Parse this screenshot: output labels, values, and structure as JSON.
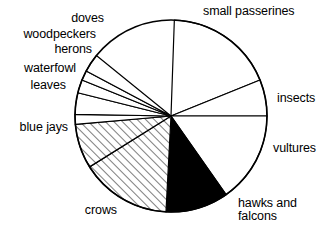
{
  "chart_data": {
    "type": "pie",
    "title": "",
    "subtitle": "",
    "xlabel": "",
    "ylabel": "",
    "legend_position": "outside-labels",
    "grid": false,
    "units": "percent",
    "start_angle_deg": 88,
    "direction": "clockwise",
    "center": {
      "x": 171,
      "y": 116
    },
    "radius": 96,
    "categories": [
      "small passerines",
      "insects",
      "vultures",
      "hawks and falcons",
      "crows",
      "blue jays",
      "leaves",
      "waterfowl",
      "herons",
      "woodpeckers",
      "doves"
    ],
    "values": [
      18.3,
      6.1,
      15.3,
      10.6,
      15.3,
      7.5,
      1.7,
      3.6,
      2.2,
      1.7,
      3.1
    ],
    "slices": [
      {
        "label": "small passerines",
        "value": 18.3,
        "start_deg": 88,
        "end_deg": 22,
        "fill": "white",
        "pattern": "none"
      },
      {
        "label": "insects",
        "value": 6.1,
        "start_deg": 22,
        "end_deg": 0,
        "fill": "white",
        "pattern": "none"
      },
      {
        "label": "vultures",
        "value": 15.3,
        "start_deg": 0,
        "end_deg": -55,
        "fill": "white",
        "pattern": "none"
      },
      {
        "label": "hawks and falcons",
        "value": 10.6,
        "start_deg": -55,
        "end_deg": -93,
        "fill": "black",
        "pattern": "solid"
      },
      {
        "label": "crows",
        "value": 15.3,
        "start_deg": -93,
        "end_deg": -148,
        "fill": "white",
        "pattern": "hatch"
      },
      {
        "label": "blue jays",
        "value": 7.5,
        "start_deg": -148,
        "end_deg": -175,
        "fill": "white",
        "pattern": "hatch"
      },
      {
        "label": "leaves",
        "value": 1.7,
        "start_deg": -175,
        "end_deg": 179,
        "fill": "white",
        "pattern": "none"
      },
      {
        "label": "waterfowl",
        "value": 3.6,
        "start_deg": 179,
        "end_deg": 166,
        "fill": "white",
        "pattern": "none"
      },
      {
        "label": "herons",
        "value": 2.2,
        "start_deg": 166,
        "end_deg": 158,
        "fill": "white",
        "pattern": "none"
      },
      {
        "label": "woodpeckers",
        "value": 1.7,
        "start_deg": 158,
        "end_deg": 152,
        "fill": "white",
        "pattern": "none"
      },
      {
        "label": "doves",
        "value": 3.1,
        "start_deg": 152,
        "end_deg": 141,
        "fill": "white",
        "pattern": "none"
      }
    ],
    "colors": {
      "outline": "#000000",
      "solid_slice": "#000000",
      "plain_slice": "#ffffff",
      "background": "#ffffff"
    }
  },
  "labels": {
    "small_passerines": "small passerines",
    "insects": "insects",
    "vultures": "vultures",
    "hawks_and_falcons_line1": "hawks and",
    "hawks_and_falcons_line2": "falcons",
    "crows": "crows",
    "blue_jays": "blue jays",
    "leaves": "leaves",
    "waterfowl": "waterfowl",
    "herons": "herons",
    "woodpeckers": "woodpeckers",
    "doves": "doves"
  }
}
